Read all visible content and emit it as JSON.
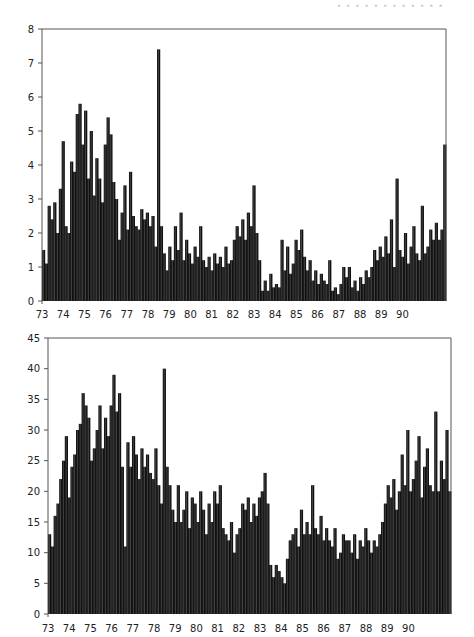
{
  "header": {
    "text": "• • • • • • •  • • • • •"
  },
  "chart_data": [
    {
      "type": "bar",
      "title": "",
      "xlabel": "",
      "ylabel": "",
      "x_tick_labels": [
        "73",
        "74",
        "75",
        "76",
        "77",
        "78",
        "79",
        "80",
        "81",
        "82",
        "83",
        "84",
        "85",
        "86",
        "87",
        "88",
        "89",
        "90"
      ],
      "y_tick_labels": [
        "0",
        "1",
        "2",
        "3",
        "4",
        "5",
        "6",
        "7",
        "8"
      ],
      "ylim": [
        0,
        8
      ],
      "grid": false,
      "points_per_year": 8,
      "values": [
        1.5,
        1.1,
        2.8,
        2.4,
        2.9,
        2.0,
        3.3,
        4.7,
        2.2,
        2.0,
        4.1,
        3.8,
        5.5,
        5.8,
        4.6,
        5.6,
        3.6,
        5.0,
        3.1,
        4.2,
        3.6,
        2.9,
        4.6,
        5.4,
        4.9,
        3.5,
        3.0,
        1.8,
        2.6,
        3.4,
        2.1,
        3.8,
        2.5,
        2.2,
        2.1,
        2.7,
        2.4,
        2.6,
        2.2,
        2.5,
        1.6,
        7.4,
        2.2,
        1.4,
        0.9,
        1.6,
        1.2,
        2.2,
        1.5,
        2.6,
        1.2,
        1.8,
        1.4,
        1.1,
        1.6,
        1.3,
        2.2,
        1.2,
        1.0,
        1.3,
        0.9,
        1.4,
        1.1,
        1.3,
        1.0,
        1.6,
        1.1,
        1.2,
        1.8,
        2.2,
        1.9,
        2.4,
        1.8,
        2.6,
        2.2,
        3.4,
        2.0,
        1.2,
        0.3,
        0.6,
        0.3,
        0.8,
        0.4,
        0.5,
        0.4,
        1.8,
        0.9,
        1.6,
        0.8,
        1.1,
        1.8,
        1.5,
        2.1,
        1.3,
        0.9,
        1.2,
        0.6,
        0.9,
        0.5,
        0.8,
        0.6,
        0.5,
        1.2,
        0.3,
        0.4,
        0.2,
        0.5,
        1.0,
        0.7,
        1.0,
        0.4,
        0.6,
        0.3,
        0.7,
        0.5,
        0.9,
        0.7,
        1.0,
        1.5,
        1.2,
        1.6,
        1.3,
        1.9,
        1.4,
        2.4,
        1.0,
        3.6,
        1.5,
        1.3,
        2.0,
        1.1,
        1.6,
        2.2,
        1.4,
        1.2,
        2.8,
        1.4,
        1.6,
        2.1,
        1.8,
        2.3,
        1.8,
        2.1,
        4.6
      ]
    },
    {
      "type": "bar",
      "title": "",
      "xlabel": "",
      "ylabel": "",
      "x_tick_labels": [
        "73",
        "74",
        "75",
        "76",
        "77",
        "78",
        "79",
        "80",
        "81",
        "82",
        "83",
        "84",
        "85",
        "86",
        "87",
        "88",
        "89",
        "90"
      ],
      "y_tick_labels": [
        "0",
        "5",
        "10",
        "15",
        "20",
        "25",
        "30",
        "35",
        "40",
        "45"
      ],
      "ylim": [
        0,
        45
      ],
      "grid": false,
      "points_per_year": 8,
      "values": [
        13,
        11,
        16,
        18,
        22,
        25,
        29,
        19,
        24,
        26,
        30,
        31,
        36,
        34,
        32,
        25,
        27,
        30,
        34,
        27,
        32,
        29,
        34,
        39,
        33,
        36,
        24,
        11,
        28,
        24,
        29,
        26,
        22,
        27,
        24,
        26,
        23,
        22,
        27,
        21,
        18,
        40,
        24,
        21,
        17,
        15,
        21,
        15,
        17,
        20,
        14,
        19,
        18,
        15,
        20,
        17,
        13,
        18,
        15,
        20,
        18,
        21,
        14,
        13,
        12,
        15,
        10,
        13,
        14,
        18,
        17,
        19,
        15,
        18,
        16,
        19,
        20,
        23,
        18,
        8,
        6,
        8,
        7,
        6,
        5,
        9,
        12,
        13,
        14,
        11,
        17,
        13,
        15,
        13,
        21,
        14,
        13,
        16,
        12,
        14,
        12,
        11,
        14,
        9,
        10,
        13,
        12,
        12,
        10,
        13,
        9,
        12,
        11,
        14,
        12,
        10,
        12,
        11,
        13,
        15,
        18,
        21,
        19,
        22,
        17,
        20,
        26,
        21,
        30,
        20,
        22,
        25,
        29,
        19,
        24,
        27,
        21,
        20,
        33,
        20,
        25,
        22,
        30,
        20
      ]
    }
  ]
}
